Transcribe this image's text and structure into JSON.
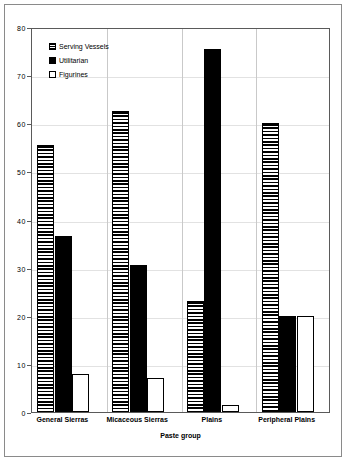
{
  "chart_data": {
    "type": "bar",
    "title": "",
    "xlabel": "Paste group",
    "ylabel": "",
    "ylim": [
      0,
      80
    ],
    "yticks": [
      0,
      10,
      20,
      30,
      40,
      50,
      60,
      70,
      80
    ],
    "grid": true,
    "legend_position": "top-left",
    "categories": [
      "General Sierras",
      "Micaceous Sierras",
      "Plains",
      "Peripheral Plains"
    ],
    "series": [
      {
        "name": "Serving Vessels",
        "pattern": "horizontal-hatch",
        "color": "#000000",
        "values": [
          55.5,
          62.5,
          23,
          60
        ]
      },
      {
        "name": "Utilitarian",
        "pattern": "solid",
        "color": "#000000",
        "values": [
          36.5,
          30.5,
          75.5,
          20
        ]
      },
      {
        "name": "Figurines",
        "pattern": "empty",
        "color": "#ffffff",
        "values": [
          8,
          7,
          1.5,
          20
        ]
      }
    ]
  },
  "frame": {
    "border_color": "#8a8a8a",
    "plot_border_color": "#5a5a5a",
    "grid_color": "#e2e2e2"
  }
}
